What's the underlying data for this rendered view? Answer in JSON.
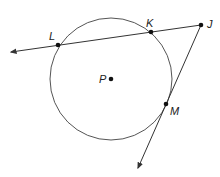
{
  "diagram": {
    "type": "geometry",
    "circle": {
      "center_label": "P",
      "cx": 111,
      "cy": 79,
      "r": 61
    },
    "points": [
      {
        "label": "L",
        "x": 58,
        "y": 45,
        "lx": 49,
        "ly": 40
      },
      {
        "label": "K",
        "x": 151,
        "y": 32,
        "lx": 146,
        "ly": 27
      },
      {
        "label": "J",
        "x": 201,
        "y": 25,
        "lx": 207,
        "ly": 28
      },
      {
        "label": "P",
        "x": 111,
        "y": 79,
        "lx": 99,
        "ly": 83
      },
      {
        "label": "M",
        "x": 166,
        "y": 104,
        "lx": 170,
        "ly": 115
      }
    ],
    "lines": [
      {
        "name": "secant-JL",
        "from": "J",
        "to_arrow": [
          11,
          52
        ]
      },
      {
        "name": "tangent-JM",
        "from": "J",
        "to_arrow": [
          138,
          168
        ]
      }
    ],
    "colors": {
      "stroke": "#333333",
      "point": "#111111"
    }
  }
}
